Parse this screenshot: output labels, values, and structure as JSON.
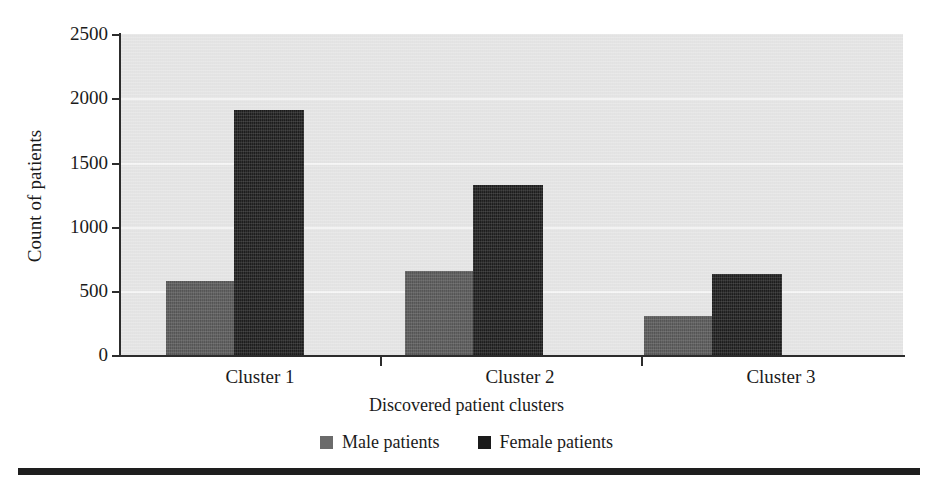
{
  "chart_data": {
    "type": "bar",
    "title": "",
    "subtitle": "",
    "xlabel": "Discovered patient clusters",
    "ylabel": "Count of patients",
    "categories": [
      "Cluster 1",
      "Cluster 2",
      "Cluster 3"
    ],
    "series": [
      {
        "name": "Male patients",
        "values": [
          584,
          662,
          312
        ],
        "color": "#595959"
      },
      {
        "name": "Female patients",
        "values": [
          1908,
          1324,
          639
        ],
        "color": "#1b1b1b"
      }
    ],
    "ylim": [
      0,
      2500
    ],
    "yticks": [
      0,
      500,
      1000,
      1500,
      2000,
      2500
    ],
    "ytick_labels": [
      "0",
      "500",
      "1000",
      "1500",
      "2000",
      "2500"
    ],
    "grid": "horizontal",
    "legend_position": "bottom",
    "plot_background": "#e7e7e7",
    "axis_color": "#2c2c2c",
    "annotations": []
  },
  "axes": {
    "y_title": "Count of patients",
    "x_title": "Discovered patient clusters",
    "y_tick_labels": [
      "2500",
      "2000",
      "1500",
      "1000",
      "500",
      "0"
    ]
  },
  "categories": {
    "c0": "Cluster 1",
    "c1": "Cluster 2",
    "c2": "Cluster 3"
  },
  "legend": {
    "items": [
      {
        "label": "Male patients",
        "color": "#6b6b6b"
      },
      {
        "label": "Female patients",
        "color": "#1b1b1b"
      }
    ]
  }
}
